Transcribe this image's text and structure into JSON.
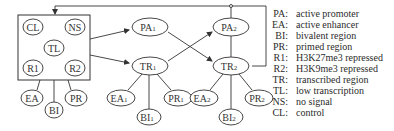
{
  "diagram": {
    "box_nodes": [
      {
        "id": "CL",
        "label": "CL",
        "sub": ""
      },
      {
        "id": "NS",
        "label": "NS",
        "sub": ""
      },
      {
        "id": "TL",
        "label": "TL",
        "sub": ""
      },
      {
        "id": "R1",
        "label": "R1",
        "sub": ""
      },
      {
        "id": "R2",
        "label": "R2",
        "sub": ""
      }
    ],
    "group0": {
      "EA": {
        "label": "EA",
        "sub": ""
      },
      "BI": {
        "label": "BI",
        "sub": ""
      },
      "PR": {
        "label": "PR",
        "sub": ""
      }
    },
    "group1": {
      "PA": {
        "label": "PA",
        "sub": "1"
      },
      "TR": {
        "label": "TR",
        "sub": "1"
      },
      "EA": {
        "label": "EA",
        "sub": "1"
      },
      "BI": {
        "label": "BI",
        "sub": "1"
      },
      "PR": {
        "label": "PR",
        "sub": "1"
      }
    },
    "group2": {
      "PA": {
        "label": "PA",
        "sub": "2"
      },
      "TR": {
        "label": "TR",
        "sub": "2"
      },
      "EA": {
        "label": "EA",
        "sub": "2"
      },
      "BI": {
        "label": "BI",
        "sub": "2"
      },
      "PR": {
        "label": "PR",
        "sub": "2"
      }
    },
    "edges": [
      {
        "from": "box",
        "to": "PA1",
        "type": "arrow"
      },
      {
        "from": "box",
        "to": "TR1",
        "type": "arrow"
      },
      {
        "from": "PA1",
        "to": "TR2",
        "type": "arrow"
      },
      {
        "from": "TR1",
        "to": "PA2",
        "type": "arrow"
      },
      {
        "from": "PA2",
        "to": "TR2",
        "type": "line"
      },
      {
        "from": "TR2",
        "to": "box",
        "type": "feedback-arrow"
      },
      {
        "from": "box",
        "to": "EA",
        "type": "line"
      },
      {
        "from": "box",
        "to": "BI",
        "type": "line"
      },
      {
        "from": "box",
        "to": "PR",
        "type": "line"
      },
      {
        "from": "TR1",
        "to": "EA1",
        "type": "line"
      },
      {
        "from": "TR1",
        "to": "BI1",
        "type": "line"
      },
      {
        "from": "TR1",
        "to": "PR1",
        "type": "line"
      },
      {
        "from": "TR2",
        "to": "EA2",
        "type": "line"
      },
      {
        "from": "TR2",
        "to": "BI2",
        "type": "line"
      },
      {
        "from": "TR2",
        "to": "PR2",
        "type": "line"
      }
    ]
  },
  "legend": [
    {
      "key": "PA:",
      "value": "active promoter"
    },
    {
      "key": "EA:",
      "value": "active enhancer"
    },
    {
      "key": "BI:",
      "value": "bivalent region"
    },
    {
      "key": "PR:",
      "value": "primed region"
    },
    {
      "key": "R1:",
      "value": "H3K27me3 repressed"
    },
    {
      "key": "R2:",
      "value": "H3K9me3 repressed"
    },
    {
      "key": "TR:",
      "value": "transcribed region"
    },
    {
      "key": "TL:",
      "value": "low transcription"
    },
    {
      "key": "NS:",
      "value": "no signal"
    },
    {
      "key": "CL:",
      "value": "control"
    }
  ],
  "colors": {
    "stroke": "#333333",
    "background": "#ffffff"
  }
}
